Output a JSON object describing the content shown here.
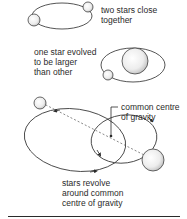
{
  "panels": [
    {
      "id": "close",
      "label_lines": [
        "two stars close",
        "together"
      ]
    },
    {
      "id": "evolved",
      "label_lines": [
        "one star evolved",
        "to be larger",
        "than other"
      ]
    },
    {
      "id": "revolve",
      "label_lines": [
        "stars revolve",
        "around common",
        "centre of gravity"
      ],
      "callout_lines": [
        "common centre",
        "of gravity"
      ]
    }
  ],
  "colors": {
    "line": "#2a2a2a",
    "star_fill": "#e8e8e8",
    "background": "#ffffff"
  }
}
